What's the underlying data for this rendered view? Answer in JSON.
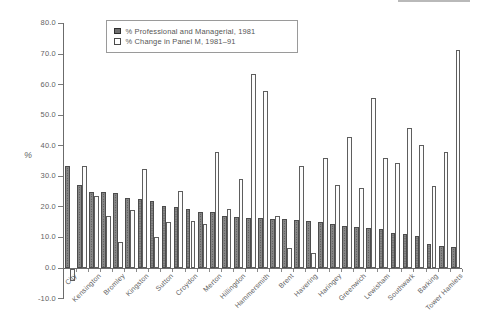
{
  "colors": {
    "axis": "#6b6b6b",
    "text": "#5a5a5a",
    "bar_dark_fill": "#868686",
    "bar_open_fill": "#fcfcfc",
    "bar_outline": "#4c4c4c"
  },
  "legend": {
    "items": [
      {
        "marker": "filled-square",
        "label": "% Professional and Managerial, 1981"
      },
      {
        "marker": "open-square",
        "label": "% Change in Panel M, 1981–91"
      }
    ]
  },
  "y_axis": {
    "title": "%",
    "tick_labels": [
      "80.0",
      "70.0",
      "60.0",
      "50.0",
      "40.0",
      "30.0",
      "20.0",
      "10.0",
      "0.0",
      "-10.0"
    ],
    "tick_values": [
      80,
      70,
      60,
      50,
      40,
      30,
      20,
      10,
      0,
      -10
    ]
  },
  "chart_data": {
    "type": "bar",
    "title": "",
    "xlabel": "",
    "ylabel": "%",
    "ylim": [
      -10,
      80
    ],
    "grid": false,
    "legend_position": "top-left-inside",
    "categories": [
      "City",
      "",
      "Kensington",
      "",
      "Bromley",
      "",
      "Kingston",
      "",
      "Sutton",
      "",
      "Croydon",
      "",
      "Merton",
      "",
      "Hillingdon",
      "",
      "Hammersmith",
      "",
      "Brent",
      "",
      "Havering",
      "",
      "Haringey",
      "",
      "Greenwich",
      "",
      "Lewisham",
      "",
      "Southwark",
      "",
      "Barking",
      "",
      "Tower Hamlets"
    ],
    "label_interval_note": "category labels shown on every second bar pair",
    "series": [
      {
        "name": "% Professional and Managerial, 1981",
        "style": "dark",
        "values": [
          33.5,
          27,
          25,
          24.8,
          24.6,
          23,
          22.5,
          21.8,
          20.3,
          20,
          19.4,
          18.4,
          18.2,
          17,
          16.6,
          16.4,
          16.2,
          16,
          15.9,
          15.8,
          15.3,
          15.1,
          14.4,
          13.6,
          13.3,
          13,
          12.7,
          11.4,
          11.1,
          10.5,
          7.8,
          7.2,
          6.8
        ]
      },
      {
        "name": "% Change in Panel M, 1981–91",
        "style": "open",
        "values": [
          -4,
          33.5,
          23.5,
          17,
          8.5,
          19,
          32.5,
          10,
          15,
          25.3,
          15.5,
          14.5,
          38,
          19.3,
          29,
          63.5,
          58,
          17,
          6.5,
          33.5,
          5,
          36,
          27.3,
          43,
          26.2,
          55.6,
          36,
          34.3,
          45.8,
          40.3,
          26.7,
          37.8,
          71.2
        ]
      }
    ]
  }
}
